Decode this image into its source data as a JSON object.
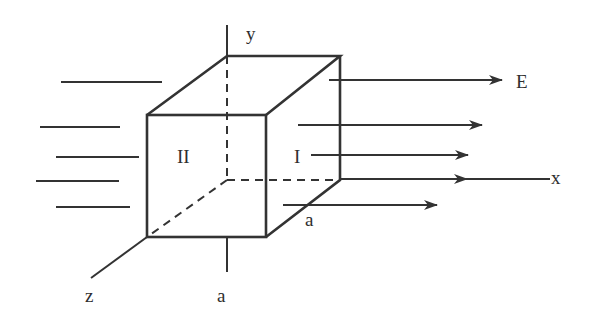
{
  "diagram": {
    "colors": {
      "ink": "#333333",
      "background": "#ffffff"
    },
    "labels": {
      "y_axis": "y",
      "x_axis": "x",
      "z_axis": "z",
      "field": "E",
      "face_left": "II",
      "face_right": "I",
      "side_bottom": "a",
      "side_depth": "a"
    },
    "field_lines_incoming": 5,
    "field_lines_outgoing": 5
  }
}
